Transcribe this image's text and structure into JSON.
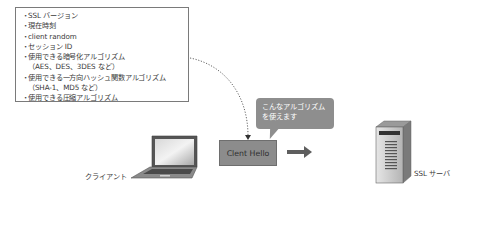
{
  "client_hello_contents": {
    "items": [
      {
        "text": "SSL バージョン"
      },
      {
        "text": "現在時刻"
      },
      {
        "text": "client random"
      },
      {
        "text": "セッション ID"
      },
      {
        "text": "使用できる暗号化アルゴリズム",
        "note": "（AES、DES、3DES など）"
      },
      {
        "text": "使用できる一方向ハッシュ関数アルゴリズム",
        "note": "（SHA-1、MD5 など）"
      },
      {
        "text": "使用できる圧縮アルゴリズム"
      }
    ],
    "bullet": "・"
  },
  "callout": {
    "line1": "こんなアルゴリズム",
    "line2": "を使えます"
  },
  "message": {
    "label": "Clent Hello"
  },
  "nodes": {
    "client": {
      "label": "クライアント",
      "icon": "laptop-icon"
    },
    "server": {
      "label": "SSL サーバ",
      "icon": "server-icon"
    }
  },
  "colors": {
    "box_border": "#7a7a7a",
    "message_fill": "#8c8c8c",
    "callout_fill": "#8e8e8e",
    "arrow": "#5e5e5e",
    "dotted_line": "#555555"
  }
}
